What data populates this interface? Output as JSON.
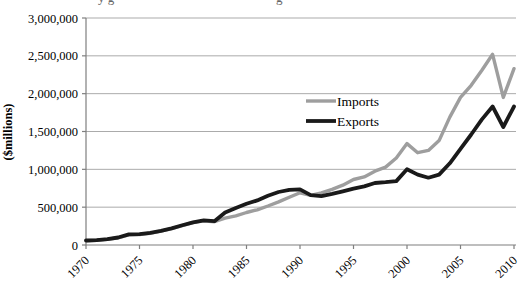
{
  "page": {
    "background": "#ffffff"
  },
  "clipped_caption": {
    "fragments": [
      {
        "text": "y g",
        "x": 98
      },
      {
        "text": "g",
        "x": 276
      }
    ]
  },
  "chart_data": {
    "type": "line",
    "title": "",
    "xlabel": "",
    "ylabel": "($millions)",
    "grid": true,
    "legend_position": "inside-upper-middle",
    "ylim": [
      0,
      3000000
    ],
    "yticks": [
      0,
      500000,
      1000000,
      1500000,
      2000000,
      2500000,
      3000000
    ],
    "ytick_labels": [
      "0",
      "500,000",
      "1,000,000",
      "1,500,000",
      "2,000,000",
      "2,500,000",
      "3,000,000"
    ],
    "xticks": [
      1970,
      1975,
      1980,
      1985,
      1990,
      1995,
      2000,
      2005,
      2010
    ],
    "xtick_labels": [
      "1970",
      "1975",
      "1980",
      "1985",
      "1990",
      "1995",
      "2000",
      "2005",
      "2010"
    ],
    "x": [
      1970,
      1971,
      1972,
      1973,
      1974,
      1975,
      1976,
      1977,
      1978,
      1979,
      1980,
      1981,
      1982,
      1983,
      1984,
      1985,
      1986,
      1987,
      1988,
      1989,
      1990,
      1991,
      1992,
      1993,
      1994,
      1995,
      1996,
      1997,
      1998,
      1999,
      2000,
      2001,
      2002,
      2003,
      2004,
      2005,
      2006,
      2007,
      2008,
      2009,
      2010
    ],
    "series": [
      {
        "name": "Imports",
        "color": "#9e9e9e",
        "stroke_width": 3.4,
        "values": [
          55000,
          62000,
          74000,
          95000,
          135000,
          138000,
          155000,
          182000,
          215000,
          255000,
          295000,
          320000,
          308000,
          355000,
          385000,
          430000,
          465000,
          515000,
          570000,
          630000,
          690000,
          655000,
          690000,
          735000,
          790000,
          865000,
          900000,
          975000,
          1030000,
          1150000,
          1340000,
          1220000,
          1250000,
          1380000,
          1690000,
          1950000,
          2110000,
          2310000,
          2520000,
          1950000,
          2330000
        ]
      },
      {
        "name": "Exports",
        "color": "#1a1a1a",
        "stroke_width": 3.8,
        "values": [
          59000,
          65000,
          77000,
          99000,
          140000,
          143000,
          160000,
          186000,
          220000,
          260000,
          300000,
          327000,
          315000,
          430000,
          490000,
          545000,
          590000,
          650000,
          700000,
          728000,
          735000,
          660000,
          645000,
          675000,
          710000,
          745000,
          775000,
          820000,
          830000,
          845000,
          1000000,
          930000,
          890000,
          930000,
          1080000,
          1270000,
          1460000,
          1660000,
          1830000,
          1560000,
          1830000
        ]
      }
    ],
    "colors": {
      "gridline": "#ababab",
      "axis": "#7f7f7f",
      "label": "#000000"
    }
  }
}
